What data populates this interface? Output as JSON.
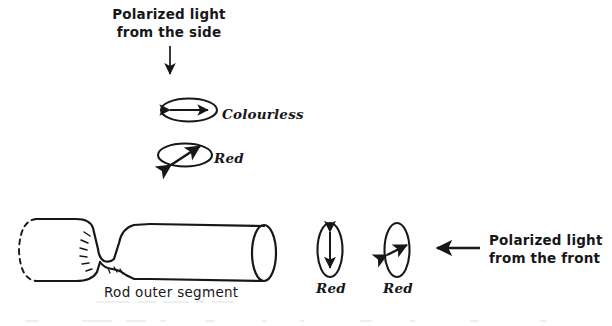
{
  "figure": {
    "title_top": "Polarized light\nfrom the side",
    "top_label_line1": "Polarized light",
    "top_label_line2": "from the side",
    "right_label_line1": "Polarized light",
    "right_label_line2": "from the front",
    "side_ellipse_labels": [
      {
        "id": "colourless",
        "label": "Colourless",
        "arrow": "horizontal-double-arrow"
      },
      {
        "id": "red-side",
        "label": "Red",
        "arrow": "diagonal-double-arrow"
      }
    ],
    "front_ellipse_labels": [
      {
        "id": "red-front-vertical",
        "label": "Red",
        "arrow": "vertical-double-arrow"
      },
      {
        "id": "red-front-diagonal",
        "label": "Red",
        "arrow": "diagonal-double-arrow"
      }
    ],
    "rod_caption": "Rod outer segment",
    "arrows": [
      {
        "id": "top-arrow",
        "direction": "down"
      },
      {
        "id": "front-arrow",
        "direction": "left"
      }
    ],
    "colors": {
      "ink": "#17171a",
      "background": "#ffffff"
    }
  }
}
